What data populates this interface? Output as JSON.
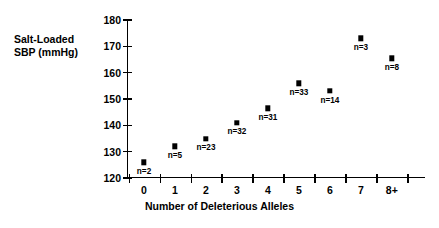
{
  "chart_data": {
    "type": "scatter",
    "title": "",
    "xlabel": "Number of Deleterious Alleles",
    "ylabel": "Salt-Loaded\nSBP (mmHg)",
    "categories": [
      "0",
      "1",
      "2",
      "3",
      "4",
      "5",
      "6",
      "7",
      "8+"
    ],
    "values": [
      126,
      132,
      135,
      141,
      146.5,
      156,
      153,
      173,
      165.5
    ],
    "point_labels": [
      "n=2",
      "n=5",
      "n=23",
      "n=32",
      "n=31",
      "n=33",
      "n=14",
      "n=3",
      "n=8"
    ],
    "ylim": [
      120,
      180
    ],
    "yticks": [
      120,
      130,
      140,
      150,
      160,
      170,
      180
    ],
    "ytick_labels": [
      "120",
      "130",
      "140",
      "150",
      "160",
      "170",
      "180"
    ],
    "grid": false,
    "legend": false,
    "marker": "filled-square",
    "marker_color": "#000000"
  }
}
